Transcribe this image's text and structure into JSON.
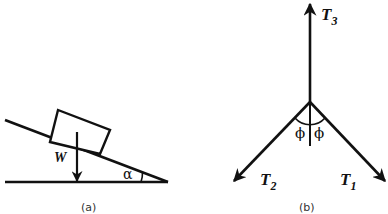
{
  "figure_a": {
    "caption": "(a)",
    "weight_label": "W",
    "angle_label": "α",
    "elements": [
      "inclined plane",
      "block",
      "weight arrow",
      "ground line",
      "angle arc"
    ]
  },
  "figure_b": {
    "caption": "(b)",
    "tension_labels": {
      "t3": {
        "main": "T",
        "sub": "3"
      },
      "t2": {
        "main": "T",
        "sub": "2"
      },
      "t1": {
        "main": "T",
        "sub": "1"
      }
    },
    "angle_left": "ϕ",
    "angle_right": "ϕ"
  },
  "colors": {
    "stroke": "#111111",
    "background": "#ffffff"
  }
}
